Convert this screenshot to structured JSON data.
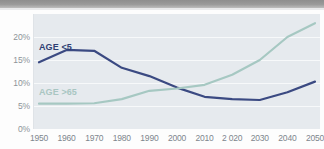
{
  "chart_data": {
    "type": "line",
    "title": "",
    "subtitle": "",
    "xlabel": "",
    "ylabel": "",
    "categories": [
      "1950",
      "1960",
      "1970",
      "1980",
      "1990",
      "2000",
      "2010",
      "2 020",
      "2030",
      "2040",
      "2050"
    ],
    "x_tick_labels": [
      "1950",
      "1960",
      "1970",
      "1980",
      "1990",
      "2000",
      "2010",
      "2 020",
      "2030",
      "2040",
      "2050"
    ],
    "y_tick_labels": [
      "0%",
      "5%",
      "10%",
      "15%",
      "20%"
    ],
    "y_tick_values": [
      0,
      5,
      10,
      15,
      20
    ],
    "ylim": [
      0,
      25
    ],
    "grid": true,
    "grid_orientation": "horizontal",
    "legend_position": "inline-annotation",
    "series": [
      {
        "name": "AGE <5",
        "color": "#3b4a82",
        "label_position": "upper-left",
        "values": [
          14.5,
          17.2,
          17.0,
          13.3,
          11.5,
          9.0,
          7.0,
          6.5,
          6.3,
          8.0,
          10.3
        ]
      },
      {
        "name": "AGE >65",
        "color": "#a6c8c2",
        "label_position": "mid-left",
        "values": [
          5.5,
          5.5,
          5.6,
          6.5,
          8.3,
          8.8,
          9.6,
          11.8,
          15.0,
          20.0,
          23.0
        ]
      }
    ],
    "annotations": [
      {
        "text": "AGE <5",
        "series": "AGE <5"
      },
      {
        "text": "AGE >65",
        "series": "AGE >65"
      }
    ],
    "colors": {
      "series_young": "#3b4a82",
      "series_old": "#a6c8c2",
      "plot_background": "#e6eaee",
      "gridline": "#f7f9fa",
      "tick_label": "#8d9499",
      "page_background": "#fdfdfd",
      "top_bar": "#9a9a9a"
    }
  }
}
